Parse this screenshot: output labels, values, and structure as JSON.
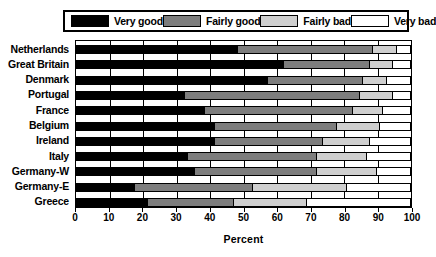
{
  "legend": {
    "items": [
      {
        "label": "Very good",
        "color": "#000000",
        "key": "very_good"
      },
      {
        "label": "Fairly good",
        "color": "#7d7d7d",
        "key": "fairly_good"
      },
      {
        "label": "Fairly bad",
        "color": "#cfcfcf",
        "key": "fairly_bad"
      },
      {
        "label": "Very bad",
        "color": "#ffffff",
        "key": "very_bad"
      }
    ]
  },
  "chart_data": {
    "type": "bar",
    "orientation": "horizontal",
    "stacked": true,
    "stack_mode": "percent",
    "title": "",
    "xlabel": "Percent",
    "ylabel": "",
    "xlim": [
      0,
      100
    ],
    "xticks": [
      0,
      10,
      20,
      30,
      40,
      50,
      60,
      70,
      80,
      90,
      100
    ],
    "xtick_labels": [
      "0",
      "10",
      "20",
      "30",
      "40",
      "50",
      "60",
      "70",
      "80",
      "90",
      "100"
    ],
    "grid": true,
    "legend_position": "top",
    "categories": [
      "Netherlands",
      "Great Britain",
      "Denmark",
      "Portugal",
      "France",
      "Belgium",
      "Ireland",
      "Italy",
      "Germany-W",
      "Germany-E",
      "Greece"
    ],
    "series": [
      {
        "name": "Very good",
        "color": "#000000",
        "values": [
          48,
          62,
          57,
          32,
          38,
          41,
          41,
          33,
          35,
          17,
          21
        ]
      },
      {
        "name": "Fairly good",
        "color": "#7d7d7d",
        "values": [
          41,
          26,
          29,
          53,
          45,
          37,
          33,
          39,
          37,
          36,
          26
        ]
      },
      {
        "name": "Fairly bad",
        "color": "#cfcfcf",
        "values": [
          7,
          7,
          7,
          10,
          9,
          13,
          14,
          15,
          18,
          28,
          22
        ]
      },
      {
        "name": "Very bad",
        "color": "#ffffff",
        "values": [
          4,
          5,
          7,
          5,
          8,
          9,
          12,
          13,
          10,
          19,
          31
        ]
      }
    ]
  }
}
